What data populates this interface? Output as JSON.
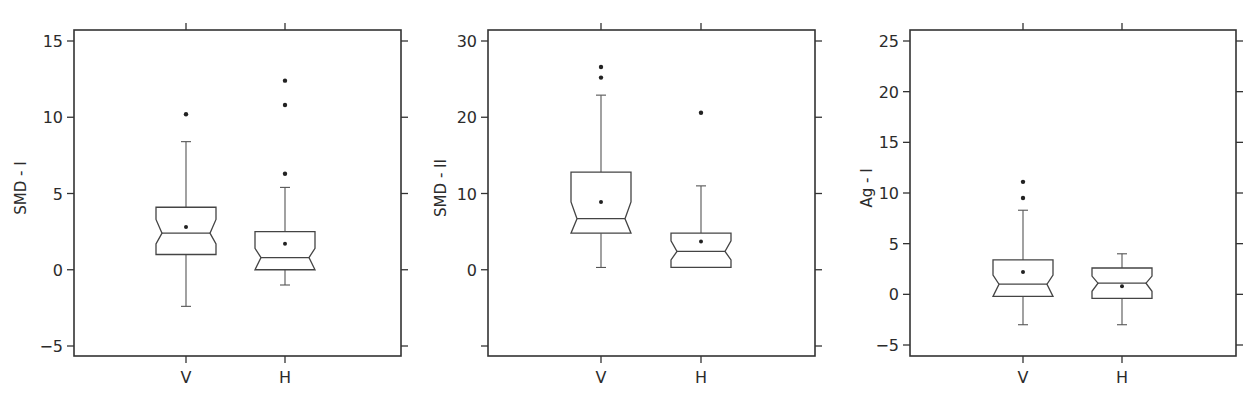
{
  "chart_data": [
    {
      "type": "boxplot",
      "variant": "notched",
      "title": "",
      "xlabel": "",
      "ylabel": "SMD - I",
      "categories": [
        "V",
        "H"
      ],
      "yticks": [
        -5,
        0,
        5,
        10,
        15
      ],
      "ytick_labels": [
        "−5",
        "0",
        "5",
        "10",
        "15"
      ],
      "ylim": [
        -6.1,
        15.7
      ],
      "grid": false,
      "series": [
        {
          "name": "V",
          "whisker_low": -2.4,
          "q1": 1.0,
          "median": 2.4,
          "q3": 4.1,
          "whisker_high": 8.4,
          "mean": 2.8,
          "notch_low": 1.7,
          "notch_high": 3.3,
          "outliers": [
            10.2
          ]
        },
        {
          "name": "H",
          "whisker_low": -1.0,
          "q1": 0.0,
          "median": 0.8,
          "q3": 2.5,
          "whisker_high": 5.4,
          "mean": 1.7,
          "notch_low": 0.0,
          "notch_high": 1.4,
          "outliers": [
            6.3,
            10.8,
            12.4
          ]
        }
      ]
    },
    {
      "type": "boxplot",
      "variant": "notched",
      "title": "",
      "xlabel": "",
      "ylabel": "SMD - II",
      "categories": [
        "V",
        "H"
      ],
      "yticks": [
        -10,
        0,
        10,
        20,
        30
      ],
      "ytick_labels": [
        "",
        "0",
        "10",
        "20",
        "30"
      ],
      "ylim": [
        -11.3,
        31.4
      ],
      "grid": false,
      "series": [
        {
          "name": "V",
          "whisker_low": 0.3,
          "q1": 4.8,
          "median": 6.7,
          "q3": 12.8,
          "whisker_high": 22.9,
          "mean": 8.9,
          "notch_low": 4.8,
          "notch_high": 8.9,
          "outliers": [
            25.2,
            26.6
          ]
        },
        {
          "name": "H",
          "whisker_low": 0.3,
          "q1": 0.3,
          "median": 2.4,
          "q3": 4.8,
          "whisker_high": 11.0,
          "mean": 3.7,
          "notch_low": 1.3,
          "notch_high": 3.8,
          "outliers": [
            20.6
          ]
        }
      ]
    },
    {
      "type": "boxplot",
      "variant": "notched",
      "title": "",
      "xlabel": "",
      "ylabel": "Ag - I",
      "categories": [
        "V",
        "H"
      ],
      "yticks": [
        -5,
        0,
        5,
        10,
        15,
        20,
        25
      ],
      "ytick_labels": [
        "−5",
        "0",
        "5",
        "10",
        "15",
        "20",
        "25"
      ],
      "ylim": [
        -6.0,
        26.1
      ],
      "grid": false,
      "series": [
        {
          "name": "V",
          "whisker_low": -3.0,
          "q1": -0.2,
          "median": 1.0,
          "q3": 3.4,
          "whisker_high": 8.3,
          "mean": 2.2,
          "notch_low": -0.2,
          "notch_high": 1.9,
          "outliers": [
            9.5,
            11.1
          ]
        },
        {
          "name": "H",
          "whisker_low": -3.0,
          "q1": -0.4,
          "median": 1.1,
          "q3": 2.6,
          "whisker_high": 4.0,
          "mean": 0.8,
          "notch_low": 0.3,
          "notch_high": 1.8,
          "outliers": []
        }
      ]
    }
  ],
  "panels": [
    {
      "ylabel": "SMD - I"
    },
    {
      "ylabel": "SMD - II"
    },
    {
      "ylabel": "Ag - I"
    }
  ]
}
